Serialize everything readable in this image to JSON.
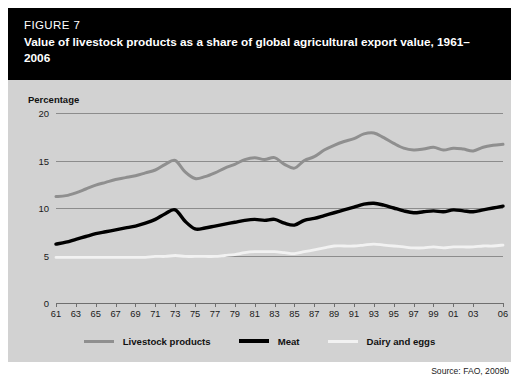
{
  "figure": {
    "number": "FIGURE 7",
    "title": "Value of livestock products as a share of global agricultural export value, 1961–2006",
    "source": "Source: FAO, 2009b"
  },
  "axis": {
    "y_title": "Percentage"
  },
  "colors": {
    "band_background": "#000000",
    "band_text": "#ffffff",
    "panel_background": "#d2d2d2",
    "gridline": "#8c8c8c",
    "livestock_products": "#8f8f8f",
    "meat": "#000000",
    "dairy_and_eggs": "#f2f2f2"
  },
  "chart_data": {
    "type": "line",
    "title": "Value of livestock products as a share of global agricultural export value, 1961–2006",
    "xlabel": "",
    "ylabel": "Percentage",
    "ylim": [
      0,
      20
    ],
    "yticks": [
      0,
      5,
      10,
      15,
      20
    ],
    "xlim": [
      1961,
      2006
    ],
    "grid": true,
    "legend_position": "bottom",
    "x": [
      1961,
      1962,
      1963,
      1964,
      1965,
      1966,
      1967,
      1968,
      1969,
      1970,
      1971,
      1972,
      1973,
      1974,
      1975,
      1976,
      1977,
      1978,
      1979,
      1980,
      1981,
      1982,
      1983,
      1984,
      1985,
      1986,
      1987,
      1988,
      1989,
      1990,
      1991,
      1992,
      1993,
      1994,
      1995,
      1996,
      1997,
      1998,
      1999,
      2000,
      2001,
      2002,
      2003,
      2004,
      2005,
      2006
    ],
    "xtick_labels": [
      "61",
      "63",
      "65",
      "67",
      "69",
      "71",
      "73",
      "75",
      "77",
      "79",
      "81",
      "83",
      "85",
      "87",
      "89",
      "91",
      "93",
      "95",
      "97",
      "99",
      "01",
      "03",
      "06"
    ],
    "xtick_values": [
      1961,
      1963,
      1965,
      1967,
      1969,
      1971,
      1973,
      1975,
      1977,
      1979,
      1981,
      1983,
      1985,
      1987,
      1989,
      1991,
      1993,
      1995,
      1997,
      1999,
      2001,
      2003,
      2006
    ],
    "series": [
      {
        "name": "Livestock products",
        "color": "#8f8f8f",
        "width": 3.0,
        "values": [
          11.2,
          11.3,
          11.6,
          12.0,
          12.4,
          12.7,
          13.0,
          13.2,
          13.4,
          13.7,
          14.0,
          14.6,
          15.0,
          13.8,
          13.1,
          13.3,
          13.7,
          14.2,
          14.6,
          15.1,
          15.3,
          15.1,
          15.3,
          14.6,
          14.2,
          15.0,
          15.4,
          16.1,
          16.6,
          17.0,
          17.3,
          17.8,
          17.9,
          17.4,
          16.8,
          16.3,
          16.1,
          16.2,
          16.4,
          16.1,
          16.3,
          16.2,
          16.0,
          16.4,
          16.6,
          16.7
        ]
      },
      {
        "name": "Meat",
        "color": "#000000",
        "width": 3.4,
        "values": [
          6.2,
          6.4,
          6.7,
          7.0,
          7.3,
          7.5,
          7.7,
          7.9,
          8.1,
          8.4,
          8.8,
          9.4,
          9.8,
          8.6,
          7.8,
          7.9,
          8.1,
          8.3,
          8.5,
          8.7,
          8.8,
          8.7,
          8.8,
          8.4,
          8.2,
          8.7,
          8.9,
          9.2,
          9.5,
          9.8,
          10.1,
          10.4,
          10.5,
          10.3,
          10.0,
          9.7,
          9.5,
          9.6,
          9.7,
          9.6,
          9.8,
          9.7,
          9.6,
          9.8,
          10.0,
          10.2
        ]
      },
      {
        "name": "Dairy and eggs",
        "color": "#f2f2f2",
        "width": 2.8,
        "values": [
          4.8,
          4.8,
          4.8,
          4.8,
          4.8,
          4.8,
          4.8,
          4.8,
          4.8,
          4.8,
          4.9,
          4.9,
          5.0,
          4.9,
          4.9,
          4.9,
          4.9,
          5.0,
          5.1,
          5.3,
          5.4,
          5.4,
          5.4,
          5.3,
          5.2,
          5.4,
          5.6,
          5.8,
          6.0,
          6.0,
          6.0,
          6.1,
          6.2,
          6.1,
          6.0,
          5.9,
          5.8,
          5.8,
          5.9,
          5.8,
          5.9,
          5.9,
          5.9,
          6.0,
          6.0,
          6.1
        ]
      }
    ]
  },
  "legend": [
    {
      "label": "Livestock products",
      "color": "#8f8f8f"
    },
    {
      "label": "Meat",
      "color": "#000000"
    },
    {
      "label": "Dairy and eggs",
      "color": "#f2f2f2"
    }
  ]
}
